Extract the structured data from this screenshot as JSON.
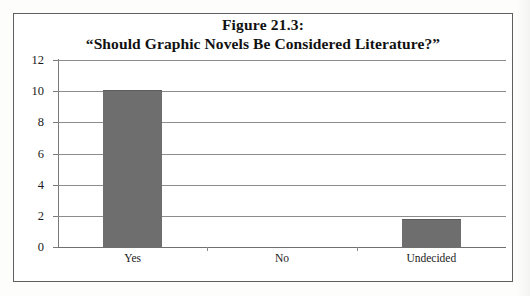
{
  "figure": {
    "title_line1": "Figure 21.3:",
    "title_line2": "“Should Graphic Novels Be Considered Literature?”"
  },
  "chart_data": {
    "type": "bar",
    "title": "Figure 21.3: “Should Graphic Novels Be Considered Literature?”",
    "categories": [
      "Yes",
      "No",
      "Undecided"
    ],
    "values": [
      10,
      0,
      1.75
    ],
    "series": [
      {
        "name": "Responses",
        "values": [
          10,
          0,
          1.75
        ]
      }
    ],
    "xlabel": "",
    "ylabel": "",
    "ylim": [
      0,
      12
    ],
    "ytick_labels": [
      "0",
      "2",
      "4",
      "6",
      "8",
      "10",
      "12"
    ],
    "ytick_values": [
      0,
      2,
      4,
      6,
      8,
      10,
      12
    ],
    "grid": true,
    "legend": false,
    "bar_color": "#6e6e6e",
    "gridline_color": "#8c8c8c",
    "frame_color": "#5f5f5f",
    "text_color": "#1a1a1a"
  },
  "axis": {
    "y_labels": [
      "12",
      "10",
      "8",
      "6",
      "4",
      "2",
      "0"
    ]
  }
}
